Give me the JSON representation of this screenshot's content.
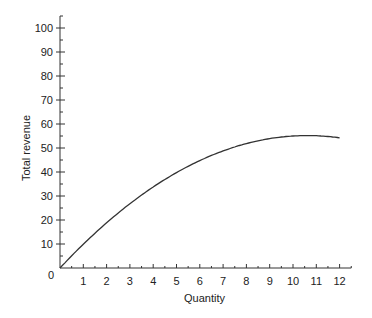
{
  "chart_data": {
    "type": "line",
    "title": "",
    "xlabel": "Quantity",
    "ylabel": "Total revenue",
    "xlim": [
      0,
      12.5
    ],
    "ylim": [
      0,
      105
    ],
    "xticks": [
      1,
      2,
      3,
      4,
      5,
      6,
      7,
      8,
      9,
      10,
      11,
      12
    ],
    "yticks": [
      10,
      20,
      30,
      40,
      50,
      60,
      70,
      80,
      90,
      100
    ],
    "origin_label": "0",
    "grid": false,
    "series": [
      {
        "name": "Total revenue",
        "x": [
          0,
          1,
          2,
          3,
          4,
          5,
          6,
          7,
          8,
          9,
          10,
          10.6,
          11,
          12
        ],
        "values": [
          0,
          9.9,
          18.8,
          26.8,
          33.8,
          39.8,
          44.8,
          48.8,
          51.8,
          53.9,
          55.0,
          55.2,
          55.1,
          54.0
        ]
      }
    ]
  }
}
